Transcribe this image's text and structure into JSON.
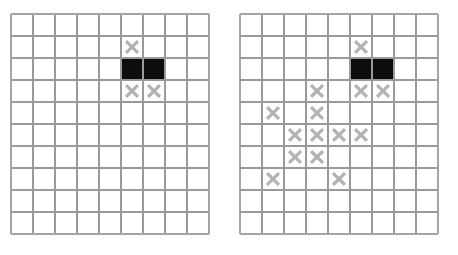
{
  "figure": {
    "title": "",
    "background_color": "#ffffff",
    "panel_count": 2
  },
  "style": {
    "grid_line_color": "#9a9a9a",
    "outer_border_color": "#a5a5a5",
    "cell_background_color": "#ffffff",
    "x_mark_color": "#b2b2b2",
    "filled_cell_color": "#0d0d0d"
  },
  "chart_data": {
    "type": "heatmap",
    "title": "",
    "xlabel": "",
    "ylabel": "",
    "grid": true,
    "legend": "none",
    "panels": [
      {
        "name": "left-grid",
        "label": "",
        "columns": 9,
        "rows": 10,
        "x": 10,
        "y": 13,
        "cell_size": 22,
        "filled_blocks": [
          {
            "row": 2,
            "col_start": 5,
            "col_end": 6
          }
        ],
        "x_marks": [
          {
            "row": 1,
            "col": 5
          },
          {
            "row": 3,
            "col": 5
          },
          {
            "row": 3,
            "col": 6
          }
        ],
        "x_mark_count": 3,
        "filled_cell_count": 2
      },
      {
        "name": "right-grid",
        "label": "",
        "columns": 9,
        "rows": 10,
        "x": 239,
        "y": 13,
        "cell_size": 22,
        "filled_blocks": [
          {
            "row": 2,
            "col_start": 5,
            "col_end": 6
          }
        ],
        "x_marks": [
          {
            "row": 1,
            "col": 5
          },
          {
            "row": 3,
            "col": 3
          },
          {
            "row": 3,
            "col": 5
          },
          {
            "row": 3,
            "col": 6
          },
          {
            "row": 4,
            "col": 1
          },
          {
            "row": 4,
            "col": 3
          },
          {
            "row": 5,
            "col": 2
          },
          {
            "row": 5,
            "col": 3
          },
          {
            "row": 5,
            "col": 4
          },
          {
            "row": 5,
            "col": 5
          },
          {
            "row": 6,
            "col": 2
          },
          {
            "row": 6,
            "col": 3
          },
          {
            "row": 7,
            "col": 1
          },
          {
            "row": 7,
            "col": 4
          }
        ],
        "x_mark_count": 14,
        "filled_cell_count": 2
      }
    ]
  }
}
